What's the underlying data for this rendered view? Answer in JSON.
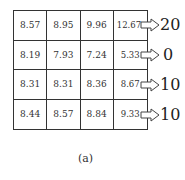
{
  "figure": {
    "caption": "(a)",
    "grid": [
      [
        "8.57",
        "8.95",
        "9.96",
        "12.67"
      ],
      [
        "8.19",
        "7.93",
        "7.24",
        "5.33"
      ],
      [
        "8.31",
        "8.31",
        "8.36",
        "8.67"
      ],
      [
        "8.44",
        "8.57",
        "8.84",
        "9.33"
      ]
    ],
    "row_outputs": [
      "20",
      "0",
      "10",
      "10"
    ]
  }
}
